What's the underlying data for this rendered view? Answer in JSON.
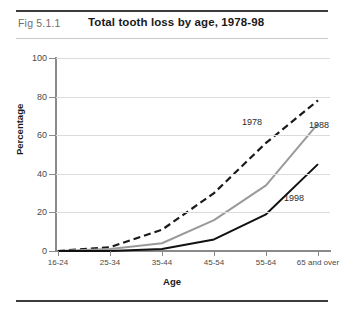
{
  "header": {
    "fig_number": "Fig 5.1.1",
    "title": "Total tooth loss by age, 1978-98"
  },
  "chart_data": {
    "type": "line",
    "title": "Total tooth loss by age, 1978-98",
    "xlabel": "Age",
    "ylabel": "Percentage",
    "ylim": [
      0,
      100
    ],
    "yticks": [
      0,
      20,
      40,
      60,
      80,
      100
    ],
    "grid": true,
    "legend": "inline-labels",
    "categories": [
      "16-24",
      "25-34",
      "35-44",
      "45-54",
      "55-64",
      "65 and over"
    ],
    "series": [
      {
        "name": "1978",
        "values": [
          0,
          2,
          11,
          30,
          56,
          78
        ],
        "color": "#1a1a1a",
        "style": "dashed"
      },
      {
        "name": "1988",
        "values": [
          0,
          1,
          4,
          16,
          34,
          66
        ],
        "color": "#9a9a9a",
        "style": "solid"
      },
      {
        "name": "1998",
        "values": [
          0,
          0,
          1,
          6,
          19,
          45
        ],
        "color": "#111111",
        "style": "solid"
      }
    ],
    "annotations": [
      {
        "text": "1978",
        "x_px": 252,
        "y_px": 122
      },
      {
        "text": "1988",
        "x_px": 319,
        "y_px": 125
      },
      {
        "text": "1998",
        "x_px": 294,
        "y_px": 198
      }
    ]
  }
}
